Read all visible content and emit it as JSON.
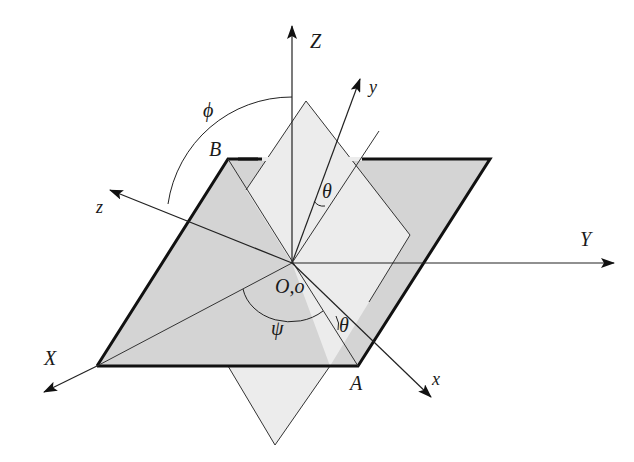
{
  "diagram": {
    "type": "euler-angles-coordinate-frames",
    "colors": {
      "background": "#ffffff",
      "reference_plane_fill": "#d4d4d4",
      "rotated_plane_fill": "#ececec",
      "line": "#222222"
    },
    "labels": {
      "Z_axis": "Z",
      "Y_axis": "Y",
      "X_axis": "X",
      "x_axis": "x",
      "y_axis": "y",
      "z_axis": "z",
      "point_B": "B",
      "point_A": "A",
      "origin": "O,o",
      "angle_phi": "ϕ",
      "angle_psi": "ψ",
      "angle_theta_upper": "θ",
      "angle_theta_lower": "θ"
    }
  }
}
